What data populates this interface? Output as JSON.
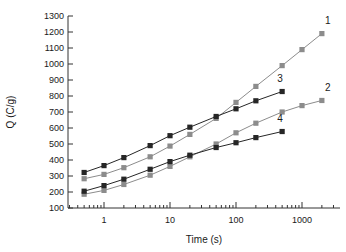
{
  "chart_data": {
    "type": "line",
    "title": "",
    "xlabel": "Time (s)",
    "ylabel": "Q (C/g)",
    "xscale": "log",
    "yscale": "linear",
    "xlim": [
      0.3,
      4000
    ],
    "ylim": [
      100,
      1300
    ],
    "ytick_labels": [
      "100",
      "200",
      "300",
      "400",
      "500",
      "600",
      "700",
      "800",
      "900",
      "1000",
      "1100",
      "1200",
      "1300"
    ],
    "ytick_values": [
      100,
      200,
      300,
      400,
      500,
      600,
      700,
      800,
      900,
      1000,
      1100,
      1200,
      1300
    ],
    "xtick_labels": [
      "1",
      "10",
      "100",
      "1000"
    ],
    "xtick_values": [
      1,
      10,
      100,
      1000
    ],
    "grid": false,
    "legend_position": "inline-end-labels",
    "marker": "filled-square",
    "series": [
      {
        "name": "1",
        "label": "1",
        "color": "#8c8c8c",
        "x": [
          0.5,
          1,
          2,
          5,
          10,
          20,
          50,
          100,
          200,
          500,
          1000,
          2000
        ],
        "y": [
          283,
          310,
          352,
          420,
          487,
          560,
          660,
          760,
          860,
          990,
          1090,
          1190
        ]
      },
      {
        "name": "2",
        "label": "2",
        "color": "#8c8c8c",
        "x": [
          0.5,
          1,
          2,
          5,
          10,
          20,
          50,
          100,
          200,
          500,
          1000,
          2000
        ],
        "y": [
          186,
          210,
          247,
          305,
          360,
          420,
          500,
          570,
          630,
          700,
          740,
          772
        ]
      },
      {
        "name": "3",
        "label": "3",
        "color": "#262626",
        "x": [
          0.5,
          1,
          2,
          5,
          10,
          20,
          50,
          100,
          200,
          500
        ],
        "y": [
          322,
          365,
          415,
          490,
          552,
          605,
          672,
          720,
          770,
          828
        ]
      },
      {
        "name": "4",
        "label": "4",
        "color": "#262626",
        "x": [
          0.5,
          1,
          2,
          5,
          10,
          20,
          50,
          100,
          200,
          500
        ],
        "y": [
          205,
          240,
          280,
          342,
          390,
          430,
          478,
          508,
          540,
          578
        ]
      }
    ]
  },
  "axes": {
    "x_title": "Time (s)",
    "y_title": "Q (C/g)"
  }
}
